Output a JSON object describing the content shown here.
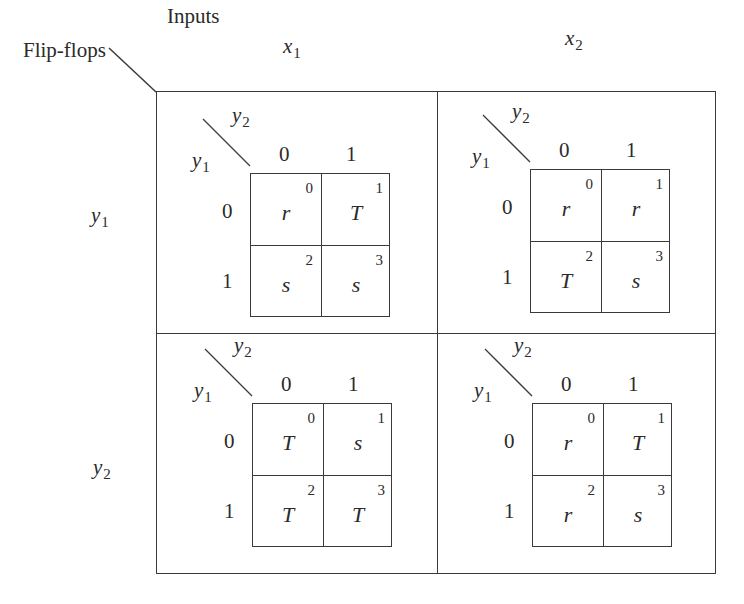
{
  "corner": {
    "row_header": "Flip-flops",
    "col_header": "Inputs"
  },
  "columns": [
    {
      "var": "x",
      "sub": "1"
    },
    {
      "var": "x",
      "sub": "2"
    }
  ],
  "rows": [
    {
      "var": "y",
      "sub": "1"
    },
    {
      "var": "y",
      "sub": "2"
    }
  ],
  "kmap_axes": {
    "col_var": "y",
    "col_sub": "2",
    "row_var": "y",
    "row_sub": "1",
    "col_values": [
      "0",
      "1"
    ],
    "row_values": [
      "0",
      "1"
    ]
  },
  "maps": [
    {
      "row": "y1",
      "col": "x1",
      "cells": [
        {
          "idx": "0",
          "val": "r"
        },
        {
          "idx": "1",
          "val": "T"
        },
        {
          "idx": "2",
          "val": "s"
        },
        {
          "idx": "3",
          "val": "s"
        }
      ]
    },
    {
      "row": "y1",
      "col": "x2",
      "cells": [
        {
          "idx": "0",
          "val": "r"
        },
        {
          "idx": "1",
          "val": "r"
        },
        {
          "idx": "2",
          "val": "T"
        },
        {
          "idx": "3",
          "val": "s"
        }
      ]
    },
    {
      "row": "y2",
      "col": "x1",
      "cells": [
        {
          "idx": "0",
          "val": "T"
        },
        {
          "idx": "1",
          "val": "s"
        },
        {
          "idx": "2",
          "val": "T"
        },
        {
          "idx": "3",
          "val": "T"
        }
      ]
    },
    {
      "row": "y2",
      "col": "x2",
      "cells": [
        {
          "idx": "0",
          "val": "r"
        },
        {
          "idx": "1",
          "val": "T"
        },
        {
          "idx": "2",
          "val": "r"
        },
        {
          "idx": "3",
          "val": "s"
        }
      ]
    }
  ]
}
